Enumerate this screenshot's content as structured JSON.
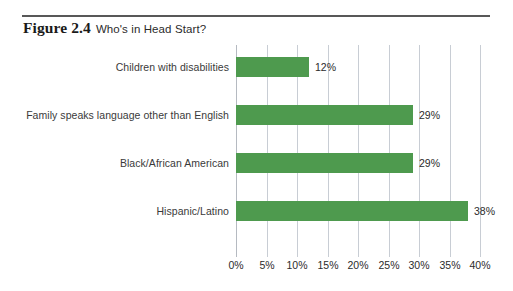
{
  "figure": {
    "number_label": "Figure 2.4",
    "title": "Who's in Head Start?"
  },
  "chart_data": {
    "type": "bar",
    "orientation": "horizontal",
    "title": "Who's in Head Start?",
    "categories": [
      "Children with disabilities",
      "Family speaks language other than English",
      "Black/African American",
      "Hispanic/Latino"
    ],
    "values": [
      12,
      29,
      29,
      38
    ],
    "value_labels": [
      "12%",
      "29%",
      "29%",
      "38%"
    ],
    "xlabel": "",
    "ylabel": "",
    "xlim": [
      0,
      40
    ],
    "xticks": [
      0,
      5,
      10,
      15,
      20,
      25,
      30,
      35,
      40
    ],
    "xtick_labels": [
      "0%",
      "5%",
      "10%",
      "15%",
      "20%",
      "25%",
      "30%",
      "35%",
      "40%"
    ],
    "grid": "vertical",
    "legend": "none",
    "bar_color": "#4e9a4e",
    "gridline_color": "#c8cdd4"
  }
}
